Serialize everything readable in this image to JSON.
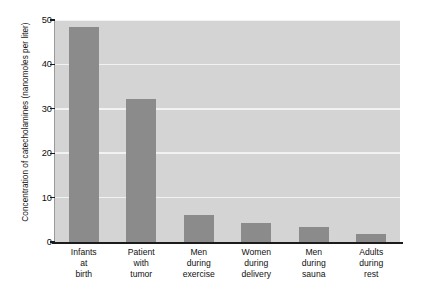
{
  "chart_data": {
    "type": "bar",
    "title": "",
    "subtitle": "",
    "xlabel": "",
    "ylabel": "Concentration of catecholamines (nanomoles per liter)",
    "categories": [
      "Infants at birth",
      "Patient with tumor",
      "Men during exercise",
      "Women during delivery",
      "Men during sauna",
      "Adults during rest"
    ],
    "category_lines": [
      [
        "Infants",
        "at",
        "birth"
      ],
      [
        "Patient",
        "with",
        "tumor"
      ],
      [
        "Men",
        "during",
        "exercise"
      ],
      [
        "Women",
        "during",
        "delivery"
      ],
      [
        "Men",
        "during",
        "sauna"
      ],
      [
        "Adults",
        "during",
        "rest"
      ]
    ],
    "values": [
      48.5,
      32.2,
      6.0,
      4.3,
      3.3,
      1.8
    ],
    "ylim": [
      0,
      50
    ],
    "yticks": [
      0,
      10,
      20,
      30,
      40,
      50
    ],
    "ytick_labels": [
      "0",
      "10",
      "20",
      "30",
      "40",
      "50"
    ],
    "grid": true,
    "grid_axis": "y",
    "legend": false,
    "legend_position": "none",
    "bar_color": "#8b8b8b",
    "plot_background": "#d4d4d4",
    "gridline_color": "#f2f2f2",
    "axis_color": "#1b1b1b",
    "figure_background": "#ffffff"
  }
}
